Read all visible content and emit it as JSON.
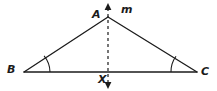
{
  "figure": {
    "name": "isosceles-triangle-line-of-symmetry",
    "background_color": "#ffffff",
    "stroke_color": "#1b1b1b",
    "labels": {
      "apex": "A",
      "line_of_symmetry": "m",
      "left_vertex": "B",
      "right_vertex": "C",
      "base_intersection": "X"
    },
    "elements": {
      "triangle_name": "triangle-ABC",
      "base_name": "segment-BC",
      "left_side_name": "segment-AB",
      "right_side_name": "segment-AC",
      "symmetry_line_name": "dashed-line-m",
      "angle_arc_b_name": "angle-arc-B",
      "angle_arc_c_name": "angle-arc-C",
      "arrow_top_name": "arrow-up",
      "arrow_bottom_name": "arrow-down"
    },
    "geometry": {
      "apex_point": [
        108,
        17
      ],
      "left_vertex_point": [
        24,
        72
      ],
      "right_vertex_point": [
        197,
        72
      ],
      "base_intersection_point": [
        108,
        72
      ],
      "symmetry_line_top": [
        108,
        6
      ],
      "symmetry_line_bottom": [
        108,
        87
      ],
      "angle_arc_radius": 26,
      "stroke_width": 1.3,
      "dash_pattern": "3,3"
    }
  }
}
